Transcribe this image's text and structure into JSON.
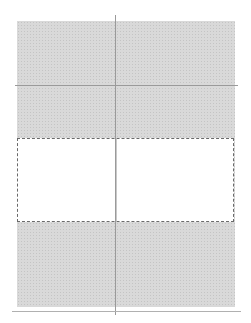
{
  "layout_grid": {
    "columns": 2,
    "rows": 4,
    "selected_row": 3,
    "colors": {
      "sheet_fill": "#d9d9d9",
      "grid_line": "#9a9a9a",
      "selection_fill": "#ffffff",
      "selection_border": "#6a6a6a"
    }
  }
}
